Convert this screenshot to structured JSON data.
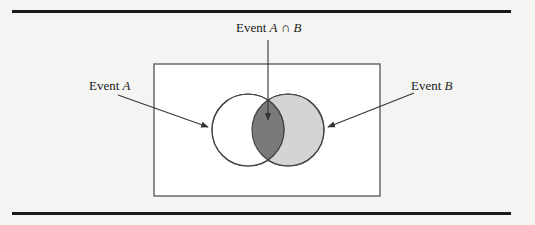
{
  "figure": {
    "type": "venn-diagram",
    "labels": {
      "event_a": {
        "prefix": "Event ",
        "var": "A"
      },
      "event_b": {
        "prefix": "Event ",
        "var": "B"
      },
      "intersection": {
        "prefix": "Event ",
        "var1": "A",
        "op": " ∩ ",
        "var2": "B"
      }
    },
    "colors": {
      "background": "#f4f4f2",
      "sample_space_fill": "#ffffff",
      "outline": "#555555",
      "circle_a_fill": "#ffffff",
      "circle_b_fill": "#d4d4d4",
      "intersection_fill": "#7a7a7a",
      "rule": "#1a1a1a"
    }
  }
}
